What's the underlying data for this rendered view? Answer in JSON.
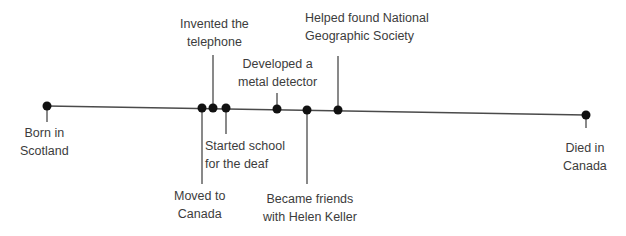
{
  "timeline": {
    "line_color": "#4a4a4a",
    "dot_color": "#111111",
    "start": {
      "x": 47,
      "y": 106
    },
    "end": {
      "x": 586,
      "y": 115
    },
    "events": [
      {
        "id": "born",
        "lines": [
          "Born in",
          "Scotland"
        ],
        "x": 47,
        "y": 106,
        "side": "below",
        "tick_end": 122
      },
      {
        "id": "moved",
        "lines": [
          "Moved to",
          "Canada"
        ],
        "x": 202,
        "y": 108,
        "side": "below",
        "tick_end": 184
      },
      {
        "id": "telephone",
        "lines": [
          "Invented the",
          "telephone"
        ],
        "x": 213,
        "y": 108,
        "side": "above",
        "tick_end": 55
      },
      {
        "id": "school",
        "lines": [
          "Started school",
          "for the deaf"
        ],
        "x": 226,
        "y": 108,
        "side": "below",
        "tick_end": 134
      },
      {
        "id": "metal",
        "lines": [
          "Developed a",
          "metal detector"
        ],
        "x": 277,
        "y": 109,
        "side": "above",
        "tick_end": 93
      },
      {
        "id": "keller",
        "lines": [
          "Became friends",
          "with Helen Keller"
        ],
        "x": 307,
        "y": 110,
        "side": "below",
        "tick_end": 184
      },
      {
        "id": "natgeo",
        "lines": [
          "Helped found National",
          "Geographic Society"
        ],
        "x": 338,
        "y": 110,
        "side": "above",
        "tick_end": 56
      },
      {
        "id": "died",
        "lines": [
          "Died in",
          "Canada"
        ],
        "x": 586,
        "y": 115,
        "side": "below",
        "tick_end": 128
      }
    ]
  }
}
